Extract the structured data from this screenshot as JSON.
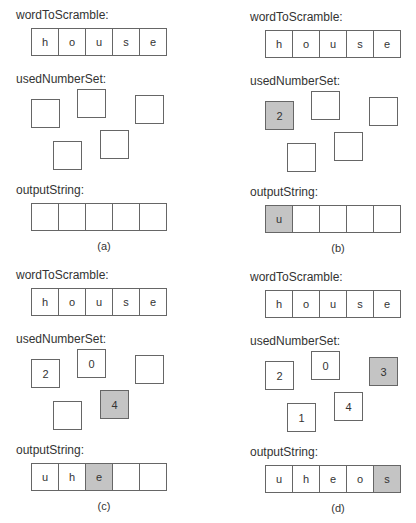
{
  "labels": {
    "word": "wordToScramble:",
    "used": "usedNumberSet:",
    "output": "outputString:"
  },
  "highlight_color": "#c4c4c4",
  "panels": [
    {
      "caption": "(a)",
      "word": [
        "h",
        "o",
        "u",
        "s",
        "e"
      ],
      "numbers": [
        "",
        "",
        "",
        "",
        ""
      ],
      "numbers_highlight": [
        false,
        false,
        false,
        false,
        false
      ],
      "output": [
        "",
        "",
        "",
        "",
        ""
      ],
      "output_highlight": [
        false,
        false,
        false,
        false,
        false
      ]
    },
    {
      "caption": "(b)",
      "word": [
        "h",
        "o",
        "u",
        "s",
        "e"
      ],
      "numbers": [
        "2",
        "",
        "",
        "",
        ""
      ],
      "numbers_highlight": [
        true,
        false,
        false,
        false,
        false
      ],
      "output": [
        "u",
        "",
        "",
        "",
        ""
      ],
      "output_highlight": [
        true,
        false,
        false,
        false,
        false
      ]
    },
    {
      "caption": "(c)",
      "word": [
        "h",
        "o",
        "u",
        "s",
        "e"
      ],
      "numbers": [
        "2",
        "0",
        "",
        "",
        "4"
      ],
      "numbers_highlight": [
        false,
        false,
        false,
        false,
        true
      ],
      "output": [
        "u",
        "h",
        "e",
        "",
        ""
      ],
      "output_highlight": [
        false,
        false,
        true,
        false,
        false
      ]
    },
    {
      "caption": "(d)",
      "word": [
        "h",
        "o",
        "u",
        "s",
        "e"
      ],
      "numbers": [
        "2",
        "0",
        "3",
        "1",
        "4"
      ],
      "numbers_highlight": [
        false,
        false,
        true,
        false,
        false
      ],
      "output": [
        "u",
        "h",
        "e",
        "o",
        "s"
      ],
      "output_highlight": [
        false,
        false,
        false,
        false,
        true
      ]
    }
  ]
}
